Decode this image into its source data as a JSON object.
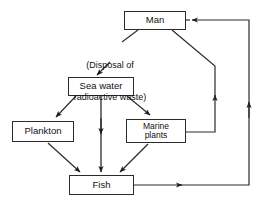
{
  "diagram": {
    "type": "flow-diagram",
    "stroke_color": "#2b2b2b",
    "text_color": "#111111",
    "background": "#ffffff",
    "nodes": [
      {
        "id": "man",
        "label": "Man",
        "x": 124,
        "y": 11,
        "w": 62,
        "h": 19,
        "font_size": 9.5
      },
      {
        "id": "sea-water",
        "label": "Sea water",
        "x": 68,
        "y": 77,
        "w": 66,
        "h": 19,
        "font_size": 9.5
      },
      {
        "id": "plankton",
        "label": "Plankton",
        "x": 12,
        "y": 121,
        "w": 62,
        "h": 21,
        "font_size": 9.5
      },
      {
        "id": "marine-plants",
        "label": "Marine\nplants",
        "x": 126,
        "y": 119,
        "w": 60,
        "h": 24,
        "font_size": 8.5
      },
      {
        "id": "fish",
        "label": "Fish",
        "x": 69,
        "y": 175,
        "w": 65,
        "h": 20,
        "font_size": 9.5
      }
    ],
    "annotations": [
      {
        "id": "disposal-note",
        "line1": "(Disposal of",
        "line2": "radioactive waste)",
        "x": 60,
        "y": 39,
        "font_size": 9
      }
    ],
    "edges": [
      {
        "id": "man-to-sea-water",
        "from": "man",
        "to": "sea-water",
        "label": "(Disposal of radioactive waste)"
      },
      {
        "id": "sea-water-to-plankton",
        "from": "sea-water",
        "to": "plankton",
        "label": ""
      },
      {
        "id": "sea-water-to-fish",
        "from": "sea-water",
        "to": "fish",
        "label": ""
      },
      {
        "id": "sea-water-to-marine",
        "from": "sea-water",
        "to": "marine-plants",
        "label": ""
      },
      {
        "id": "plankton-to-fish",
        "from": "plankton",
        "to": "fish",
        "label": ""
      },
      {
        "id": "marine-to-fish",
        "from": "marine-plants",
        "to": "fish",
        "label": ""
      },
      {
        "id": "marine-to-man",
        "from": "marine-plants",
        "to": "man",
        "label": ""
      },
      {
        "id": "fish-to-man",
        "from": "fish",
        "to": "man",
        "label": ""
      }
    ]
  }
}
